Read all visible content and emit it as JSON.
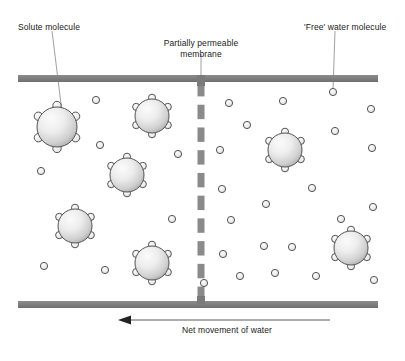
{
  "diagram": {
    "title_labels": {
      "solute": "Solute molecule",
      "membrane_line1": "Partially permeable",
      "membrane_line2": "membrane",
      "free_water": "'Free' water molecule",
      "net_movement": "Net movement of water"
    },
    "colors": {
      "bar": "#808080",
      "bar_shadow": "#6e6e6e",
      "membrane": "#8a8a8a",
      "outline": "#555555",
      "leader_line": "#888888",
      "arrow": "#222222",
      "text": "#1a1a1a",
      "sphere_light": "#f2f2f2",
      "sphere_dark": "#a8a8a8",
      "water_fill": "#e8e8e8"
    },
    "geometry": {
      "top_bar": {
        "x": 18,
        "y": 75,
        "width": 360,
        "height": 7
      },
      "bottom_bar": {
        "x": 18,
        "y": 301,
        "width": 360,
        "height": 7
      },
      "membrane_x": 201,
      "membrane_top": 82,
      "membrane_bottom": 301,
      "membrane_dash_count": 10,
      "arrow": {
        "x_start": 330,
        "x_end": 118,
        "y": 320
      }
    },
    "leaders": [
      {
        "name": "solute-leader",
        "x1": 52,
        "y1": 31,
        "x2": 62,
        "y2": 112
      },
      {
        "name": "membrane-leader",
        "x1": 201,
        "y1": 54,
        "x2": 201,
        "y2": 75
      },
      {
        "name": "free-water-leader",
        "x1": 335,
        "y1": 31,
        "x2": 333,
        "y2": 90
      }
    ],
    "solute_molecules": [
      {
        "cx": 57,
        "cy": 127,
        "r": 20,
        "side": "left"
      },
      {
        "cx": 152,
        "cy": 116,
        "r": 17,
        "side": "left"
      },
      {
        "cx": 127,
        "cy": 175,
        "r": 17,
        "side": "left"
      },
      {
        "cx": 75,
        "cy": 226,
        "r": 17,
        "side": "left"
      },
      {
        "cx": 152,
        "cy": 263,
        "r": 17,
        "side": "left"
      },
      {
        "cx": 285,
        "cy": 150,
        "r": 17,
        "side": "right"
      },
      {
        "cx": 351,
        "cy": 248,
        "r": 17,
        "side": "right"
      }
    ],
    "water_molecules": [
      {
        "cx": 96,
        "cy": 100,
        "side": "left"
      },
      {
        "cx": 100,
        "cy": 145,
        "side": "left"
      },
      {
        "cx": 41,
        "cy": 171,
        "side": "left"
      },
      {
        "cx": 172,
        "cy": 219,
        "side": "left"
      },
      {
        "cx": 44,
        "cy": 266,
        "side": "left"
      },
      {
        "cx": 105,
        "cy": 270,
        "side": "left"
      },
      {
        "cx": 178,
        "cy": 154,
        "side": "left"
      },
      {
        "cx": 229,
        "cy": 103,
        "side": "right"
      },
      {
        "cx": 283,
        "cy": 101,
        "side": "right"
      },
      {
        "cx": 333,
        "cy": 92,
        "side": "right"
      },
      {
        "cx": 371,
        "cy": 109,
        "side": "right"
      },
      {
        "cx": 247,
        "cy": 125,
        "side": "right"
      },
      {
        "cx": 335,
        "cy": 131,
        "side": "right"
      },
      {
        "cx": 220,
        "cy": 150,
        "side": "right"
      },
      {
        "cx": 372,
        "cy": 148,
        "side": "right"
      },
      {
        "cx": 222,
        "cy": 189,
        "side": "right"
      },
      {
        "cx": 312,
        "cy": 188,
        "side": "right"
      },
      {
        "cx": 266,
        "cy": 204,
        "side": "right"
      },
      {
        "cx": 341,
        "cy": 219,
        "side": "right"
      },
      {
        "cx": 231,
        "cy": 220,
        "side": "right"
      },
      {
        "cx": 264,
        "cy": 246,
        "side": "right"
      },
      {
        "cx": 373,
        "cy": 207,
        "side": "right"
      },
      {
        "cx": 223,
        "cy": 254,
        "side": "right"
      },
      {
        "cx": 275,
        "cy": 273,
        "side": "right"
      },
      {
        "cx": 292,
        "cy": 247,
        "side": "right"
      },
      {
        "cx": 240,
        "cy": 276,
        "side": "right"
      },
      {
        "cx": 316,
        "cy": 276,
        "side": "right"
      },
      {
        "cx": 374,
        "cy": 280,
        "side": "right"
      },
      {
        "cx": 204,
        "cy": 283,
        "side": "right"
      }
    ]
  }
}
